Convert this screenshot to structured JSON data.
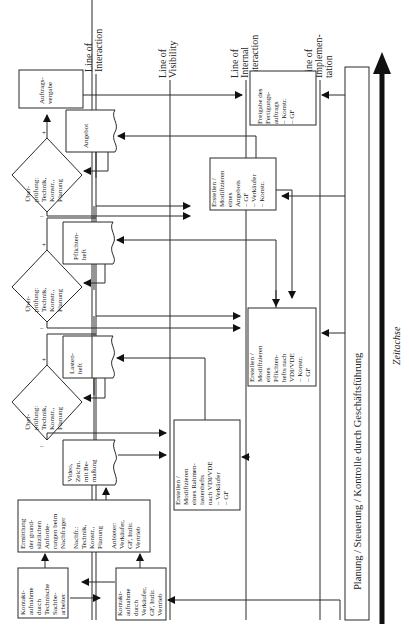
{
  "lines": {
    "interaction": [
      "Line of",
      "Interaction"
    ],
    "visibility": [
      "Line of",
      "Visibility"
    ],
    "internal_interaction": [
      "Line of",
      "Internal",
      "Interaction"
    ],
    "implementation": [
      "Line of",
      "Implemen-",
      "tation"
    ]
  },
  "customer_lane": {
    "kontakt_tech": [
      "Kontakt-",
      "aufnahme",
      "durch",
      "Technische",
      "Sachbe-",
      "arbeiter"
    ],
    "ermittlung": [
      "Ermittlung",
      "der grund-",
      "sätzlichen",
      "Anforde-",
      "rungen beim",
      "Nachfrager"
    ],
    "ermittlung_nachfr": [
      "Nachfr.:",
      "Technik,",
      "Konstr.,",
      "Planung"
    ],
    "ermittlung_anbieter": [
      "Anbieter:",
      "Verkäufer,",
      "GF, Indir.",
      "Vertrieb"
    ],
    "video": [
      "Video,",
      "Zeichn.",
      "mit Be-",
      "maßung"
    ],
    "lastenheft": [
      "Lasten-",
      "heft"
    ],
    "pflichtenheft": [
      "Pflichten-",
      "heft"
    ],
    "angebot": [
      "Angebot"
    ],
    "auftragsvergabe": [
      "Auftrags-",
      "vergabe"
    ],
    "decision": [
      "Über-",
      "prüfung:",
      "Technik,",
      "Konstr.,",
      "Planung"
    ],
    "plus": "+",
    "minus": "–"
  },
  "provider_lane": {
    "kontakt_verkaeufer": [
      "Kontakt-",
      "aufnahme",
      "durch",
      "Verkäufer,",
      "GF, Indir.",
      "Vertrieb"
    ],
    "rahmenlastenheft": [
      "Erstellen /",
      "Modifizieren",
      "eines Rahmen-",
      "lastenhefts",
      "nach VDI/VDE",
      "– Verkäufer",
      "– GF"
    ]
  },
  "internal_lane": {
    "pflichtenheft_erstellen": [
      "Erstellen /",
      "Modifizieren",
      "eines",
      "Pflichten-",
      "hefts nach",
      "VDI/VDE",
      "– Konstr.",
      "– GF"
    ],
    "angebot_erstellen": [
      "Erstellen /",
      "Modifizieren",
      "eines",
      "Angebots",
      "– GF",
      "– Verkäufer",
      "– Konstr."
    ],
    "freigabe": [
      "Freigabe des",
      "Fertigungs-",
      "auftrags",
      "– Konstr.",
      "– GF"
    ]
  },
  "planning_bar": "Planung / Steuerung / Kontrolle durch Geschäftsführung",
  "time_axis": "Zeitachse"
}
